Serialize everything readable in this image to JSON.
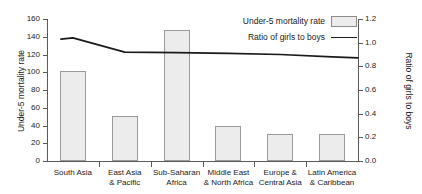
{
  "chart_data": {
    "type": "bar",
    "title": "",
    "categories": [
      "South Asia",
      "East Asia & Pacific",
      "Sub-Saharan Africa",
      "Middle East & North Africa",
      "Europe & Central Asia",
      "Latin America & Caribbean"
    ],
    "category_lines": [
      [
        "South Asia",
        ""
      ],
      [
        "East Asia",
        "& Pacific"
      ],
      [
        "Sub-Saharan",
        "Africa"
      ],
      [
        "Middle East",
        "& North Africa"
      ],
      [
        "Europe &",
        "Central Asia"
      ],
      [
        "Latin America",
        "& Caribbean"
      ]
    ],
    "series": [
      {
        "name": "Under-5 mortality rate",
        "type": "bar",
        "axis": "left",
        "values": [
          101,
          51,
          148,
          39,
          30,
          30
        ]
      },
      {
        "name": "Ratio of girls to boys",
        "type": "line",
        "axis": "right",
        "values": [
          1.04,
          0.92,
          0.915,
          0.91,
          0.9,
          0.88
        ]
      }
    ],
    "xlabel": "",
    "ylabel": "Under-5 mortality rate",
    "y2label": "Ratio of girls to boys",
    "ylim": [
      0,
      160
    ],
    "y2lim": [
      0,
      1.2
    ],
    "yticks": [
      0,
      20,
      40,
      60,
      80,
      100,
      120,
      140,
      160
    ],
    "ytick_labels": [
      "0",
      "20",
      "40",
      "60",
      "80",
      "100",
      "120",
      "140",
      "160"
    ],
    "y2ticks": [
      0.0,
      0.2,
      0.4,
      0.6,
      0.8,
      1.0,
      1.2
    ],
    "y2tick_labels": [
      "0.0",
      "0.2",
      "0.4",
      "0.6",
      "0.8",
      "1.0",
      "1.2"
    ],
    "grid": false,
    "legend_position": "top-right",
    "legend": [
      {
        "label": "Under-5 mortality rate",
        "marker": "bar-swatch"
      },
      {
        "label": "Ratio of girls to boys",
        "marker": "line-swatch"
      }
    ],
    "colors": {
      "bar_fill": "#ececec",
      "bar_edge": "#9a9a9a",
      "line": "#1a1a1a",
      "axis": "#5a5a5a",
      "text": "#1a1a1a",
      "background": "#ffffff"
    }
  }
}
